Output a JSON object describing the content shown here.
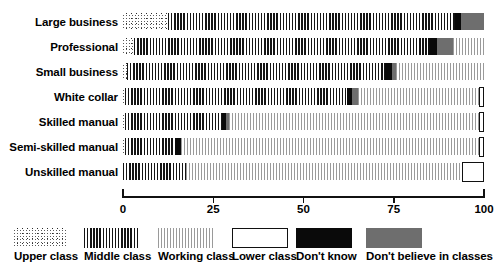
{
  "chart_data": {
    "type": "bar",
    "orientation": "horizontal",
    "stacked": true,
    "title": "",
    "xlabel": "",
    "ylabel": "",
    "xlim": [
      0,
      100
    ],
    "xticks": [
      0,
      25,
      50,
      75,
      100
    ],
    "xticklabels": [
      "0",
      "25",
      "50",
      "75",
      "100"
    ],
    "grid": false,
    "legend_position": "bottom",
    "categories": [
      "Large business",
      "Professional",
      "Small business",
      "White collar",
      "Skilled manual",
      "Semi-skilled manual",
      "Unskilled manual"
    ],
    "series": [
      {
        "name": "Upper class",
        "key": "upper",
        "values": [
          12.5,
          3.0,
          1.0,
          0.5,
          0.5,
          0.5,
          0.0
        ]
      },
      {
        "name": "Middle class",
        "key": "middle",
        "values": [
          79.5,
          81.5,
          71.5,
          61.5,
          27.0,
          14.0,
          17.5
        ]
      },
      {
        "name": "Working class",
        "key": "working",
        "values": [
          0.0,
          8.5,
          24.5,
          33.5,
          69.0,
          82.5,
          76.5
        ]
      },
      {
        "name": "Lower class",
        "key": "lower",
        "values": [
          0.0,
          0.0,
          0.0,
          1.5,
          1.5,
          1.5,
          6.0
        ]
      },
      {
        "name": "Don't know",
        "key": "dontknow",
        "values": [
          1.7,
          2.5,
          2.0,
          1.5,
          1.0,
          1.5,
          0.0
        ]
      },
      {
        "name": "Don't believe in classes",
        "key": "dontbelieve",
        "values": [
          6.3,
          4.5,
          1.0,
          1.5,
          1.0,
          0.0,
          0.0
        ]
      }
    ],
    "row_segment_order": [
      [
        "upper",
        "middle",
        "dontknow",
        "dontbelieve"
      ],
      [
        "upper",
        "middle",
        "dontknow",
        "dontbelieve",
        "working"
      ],
      [
        "upper",
        "middle",
        "dontknow",
        "dontbelieve",
        "working"
      ],
      [
        "upper",
        "middle",
        "dontknow",
        "dontbelieve",
        "working",
        "lower"
      ],
      [
        "upper",
        "middle",
        "dontknow",
        "dontbelieve",
        "working",
        "lower"
      ],
      [
        "upper",
        "middle",
        "dontknow",
        "working",
        "lower"
      ],
      [
        "middle",
        "working",
        "lower"
      ]
    ]
  },
  "legend": {
    "items": [
      {
        "label": "Upper class",
        "key": "upper",
        "swatch": "dotted-stipple"
      },
      {
        "label": "Middle class",
        "key": "middle",
        "swatch": "dense-vertical-stripes"
      },
      {
        "label": "Working class",
        "key": "working",
        "swatch": "light-vertical-stripes"
      },
      {
        "label": "Lower class",
        "key": "lower",
        "swatch": "white-outlined-box"
      },
      {
        "label": "Don't know",
        "key": "dontknow",
        "swatch": "solid-black"
      },
      {
        "label": "Don't believe in classes",
        "key": "dontbelieve",
        "swatch": "solid-gray"
      }
    ]
  },
  "colors": {
    "ink": "#111111",
    "dontknow": "#0a0a0a",
    "dontbelieve": "#6e6e6e",
    "working": "#9a9a9a",
    "middle": "#141414",
    "background": "#ffffff"
  }
}
